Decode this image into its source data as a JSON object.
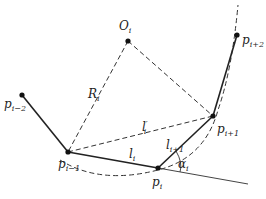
{
  "diagram": {
    "title": "",
    "points": {
      "p_i_minus_2": {
        "label": "p",
        "sub": "i−2",
        "x": 22,
        "y": 95
      },
      "p_i_minus_1": {
        "label": "p",
        "sub": "i−1",
        "x": 68,
        "y": 152
      },
      "p_i": {
        "label": "p",
        "sub": "i",
        "x": 158,
        "y": 168
      },
      "p_i_plus_1": {
        "label": "p",
        "sub": "i+1",
        "x": 213,
        "y": 116
      },
      "p_i_plus_2": {
        "label": "p",
        "sub": "i+2",
        "x": 237,
        "y": 35
      },
      "O_i": {
        "label": "O",
        "sub": "i",
        "x": 128,
        "y": 41
      }
    },
    "segments": {
      "l_i": {
        "label": "l",
        "sub": "i"
      },
      "l_i_plus_1": {
        "label": "l",
        "sub": "i+1"
      },
      "l_prime_i": {
        "label": "l",
        "sub": "i",
        "sup": "′"
      },
      "R_i": {
        "label": "R",
        "sub": "i"
      }
    },
    "angle": {
      "label": "α",
      "sub": "i"
    },
    "colors": {
      "line": "#222222",
      "dash": "#333333",
      "point": "#111111"
    }
  }
}
